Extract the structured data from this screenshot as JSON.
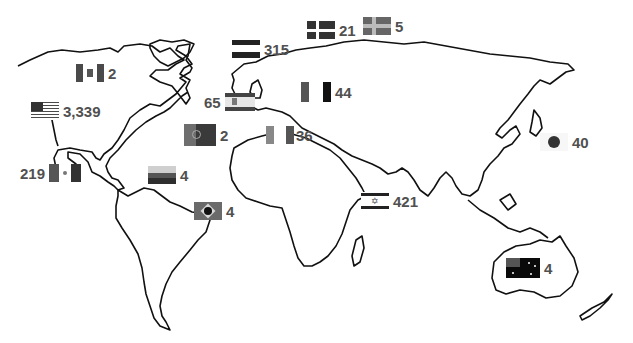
{
  "map": {
    "type": "world-outline-choropleth-markers",
    "background": "#ffffff",
    "outline_color": "#000000",
    "label_color": "#505050",
    "markers": [
      {
        "country": "United States",
        "flag_icon": "us-flag-icon",
        "count": "3,339"
      },
      {
        "country": "Israel",
        "flag_icon": "israel-flag-icon",
        "count": "421"
      },
      {
        "country": "Germany",
        "flag_icon": "germany-flag-icon",
        "count": "315"
      },
      {
        "country": "Mexico",
        "flag_icon": "mexico-flag-icon",
        "count": "219"
      },
      {
        "country": "Spain",
        "flag_icon": "spain-flag-icon",
        "count": "65"
      },
      {
        "country": "Romania",
        "flag_icon": "romania-flag-icon",
        "count": "44"
      },
      {
        "country": "Japan",
        "flag_icon": "japan-flag-icon",
        "count": "40"
      },
      {
        "country": "Italy",
        "flag_icon": "italy-flag-icon",
        "count": "36"
      },
      {
        "country": "Denmark",
        "flag_icon": "denmark-flag-icon",
        "count": "21"
      },
      {
        "country": "Sweden",
        "flag_icon": "sweden-flag-icon",
        "count": "5"
      },
      {
        "country": "Venezuela",
        "flag_icon": "venezuela-flag-icon",
        "count": "4"
      },
      {
        "country": "Brazil",
        "flag_icon": "brazil-flag-icon",
        "count": "4"
      },
      {
        "country": "Australia",
        "flag_icon": "australia-flag-icon",
        "count": "4"
      },
      {
        "country": "Canada",
        "flag_icon": "canada-flag-icon",
        "count": "2"
      },
      {
        "country": "Portugal",
        "flag_icon": "portugal-flag-icon",
        "count": "2"
      }
    ]
  }
}
